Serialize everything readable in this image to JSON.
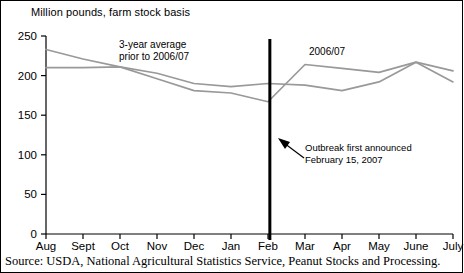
{
  "figure": {
    "axis_title": "Million pounds, farm stock basis",
    "source_note": "Source: USDA, National Agricultural Statistics Service, Peanut Stocks and Processing.",
    "border_color": "#000000",
    "background_color": "#ffffff"
  },
  "labels": {
    "series_2006_07": "2006/07",
    "series_average": "3-year average\nprior to 2006/07",
    "annotation": "Outbreak first announced\nFebruary 15, 2007"
  },
  "chart_data": {
    "type": "line",
    "title": "",
    "subtitle": "",
    "xlabel": "",
    "ylabel": "Million pounds, farm stock basis",
    "categories": [
      "Aug",
      "Sept",
      "Oct",
      "Nov",
      "Dec",
      "Jan",
      "Feb",
      "Mar",
      "Apr",
      "May",
      "June",
      "July"
    ],
    "ylim": [
      0,
      250
    ],
    "yticks": [
      0,
      50,
      100,
      150,
      200,
      250
    ],
    "ytick_labels": [
      "0",
      "50",
      "100",
      "150",
      "200",
      "250"
    ],
    "grid": false,
    "legend": "inline-annotations",
    "line_color": "#999999",
    "series": [
      {
        "name": "2006/07",
        "color": "#999999",
        "values": [
          233,
          221,
          211,
          196,
          181,
          178,
          167,
          214,
          209,
          204,
          217,
          206
        ]
      },
      {
        "name": "3-year average prior to 2006/07",
        "color": "#999999",
        "values": [
          210,
          210,
          211,
          203,
          190,
          186,
          190,
          188,
          181,
          192,
          217,
          192
        ]
      }
    ],
    "annotations": [
      {
        "name": "outbreak-marker",
        "text": "Outbreak first announced February 15, 2007",
        "x_value": 6.05,
        "type": "vertical-line",
        "color": "#000000"
      }
    ]
  }
}
